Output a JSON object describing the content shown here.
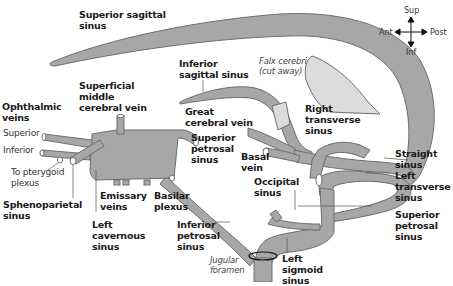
{
  "diagram": {
    "colors": {
      "vessel": "#a7a7a7",
      "outline": "#6e6e6e",
      "falx": "#dcdcdc",
      "leader": "#555555",
      "text": "#1a1a1a"
    },
    "orientation": {
      "sup": "Sup",
      "inf": "Inf",
      "ant": "Ant",
      "post": "Post"
    },
    "labels": {
      "superior_sagittal_sinus": "Superior sagittal\nsinus",
      "inferior_sagittal_sinus": "Inferior\nsagittal sinus",
      "falx_cerebri": "Falx cerebri\n(cut away)",
      "superficial_middle_cerebral_vein": "Superficial\nmiddle\ncerebral vein",
      "ophthalmic_veins": "Ophthalmic\nveins",
      "ophthalmic_superior": "Superior",
      "ophthalmic_inferior": "Inferior",
      "to_pterygoid_plexus": "To pterygoid\nplexus",
      "sphenoparietal_sinus": "Sphenoparietal\nsinus",
      "great_cerebral_vein": "Great\ncerebral vein",
      "superior_petrosal_sinus_right": "Superior\npetrosal\nsinus",
      "right_transverse_sinus": "Right\ntransverse\nsinus",
      "basal_vein": "Basal\nvein",
      "straight_sinus": "Straight\nsinus",
      "left_transverse_sinus": "Left\ntransverse\nsinus",
      "occipital_sinus": "Occipital\nsinus",
      "emissary_veins": "Emissary\nveins",
      "basilar_plexus": "Basilar\nplexus",
      "left_cavernous_sinus": "Left\ncavernous\nsinus",
      "inferior_petrosal_sinus": "Inferior\npetrosal\nsinus",
      "jugular_foramen": "Jugular\nforamen",
      "left_sigmoid_sinus": "Left\nsigmoid\nsinus",
      "superior_petrosal_sinus_left": "Superior\npetrosal\nsinus"
    }
  }
}
